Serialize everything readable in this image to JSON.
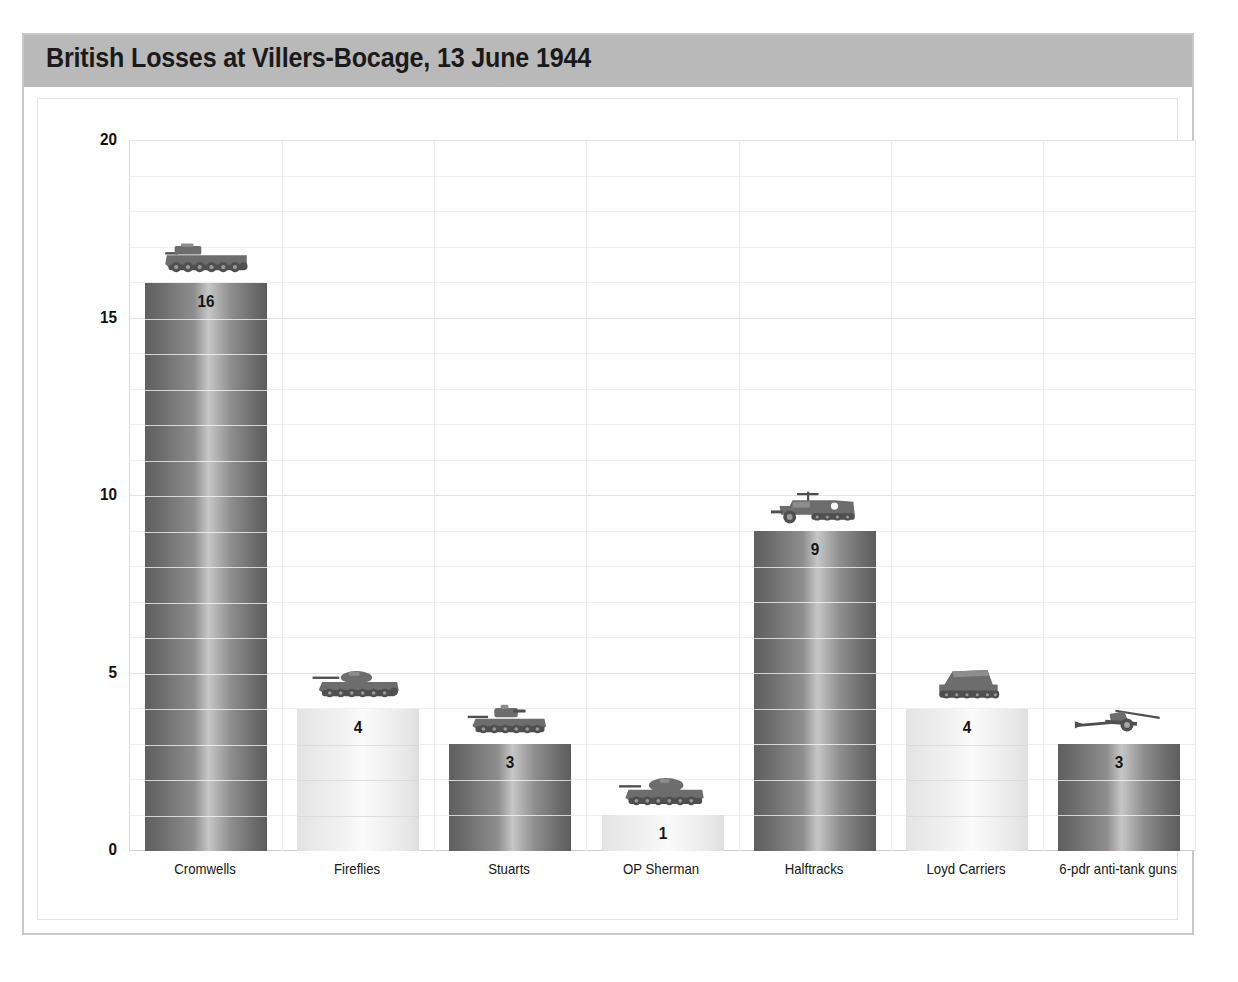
{
  "figure": {
    "title": "British Losses at Villers-Bocage, 13 June 1944",
    "title_band_color": "#b9b9b9",
    "frame_border_color": "#c9c9c9",
    "background_color": "#ffffff"
  },
  "chart_data": {
    "type": "bar",
    "title": "British Losses at Villers-Bocage, 13 June 1944",
    "xlabel": "",
    "ylabel": "",
    "ylim": [
      0,
      20
    ],
    "yticks": [
      0,
      5,
      10,
      15,
      20
    ],
    "minor_tick_step": 1,
    "grid": true,
    "legend": false,
    "categories": [
      "Cromwells",
      "Fireflies",
      "Stuarts",
      "OP Sherman",
      "Halftracks",
      "Loyd Carriers",
      "6-pdr anti-tank guns"
    ],
    "values": [
      16,
      4,
      3,
      1,
      9,
      4,
      3
    ],
    "data_labels": [
      "16",
      "4",
      "3",
      "1",
      "9",
      "4",
      "3"
    ],
    "bar_styles": [
      "dark",
      "light",
      "dark",
      "light",
      "dark",
      "light",
      "dark"
    ],
    "icons": [
      "cromwell-tank-icon",
      "sherman-firefly-tank-icon",
      "stuart-tank-icon",
      "op-sherman-tank-icon",
      "halftrack-icon",
      "loyd-carrier-icon",
      "anti-tank-gun-icon"
    ],
    "colors": {
      "bar_dark": "#7c7c7c",
      "bar_light": "#f0f0f0",
      "gridline": "#efefef",
      "axis": "#cfcfcf",
      "text": "#151515"
    }
  },
  "axis": {
    "y_tick_labels": [
      "20",
      "15",
      "10",
      "5",
      "0"
    ]
  }
}
